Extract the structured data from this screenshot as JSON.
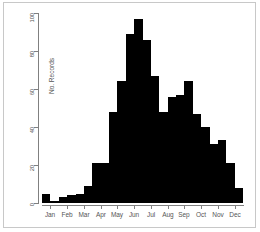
{
  "chart_data": {
    "type": "bar",
    "title": "",
    "subtitle": "",
    "xlabel": "",
    "ylabel": "No. Records",
    "ylim": [
      0,
      100
    ],
    "yticks": [
      0,
      20,
      40,
      60,
      80,
      100
    ],
    "ytick_labels": [
      "0",
      "20",
      "40",
      "60",
      "80",
      "100"
    ],
    "grid": false,
    "legend": null,
    "bar_color": "#000000",
    "axis_color": "#808080",
    "text_color": "#555555",
    "xtick_labels": [
      "Jan",
      "Feb",
      "Mar",
      "Apr",
      "May",
      "Jun",
      "Jul",
      "Aug",
      "Sep",
      "Oct",
      "Nov",
      "Dec"
    ],
    "note": "Histogram of records per half-month bin across the year; 24 bins, two per month.",
    "categories": [
      "Jan-1",
      "Jan-2",
      "Feb-1",
      "Feb-2",
      "Mar-1",
      "Mar-2",
      "Apr-1",
      "Apr-2",
      "May-1",
      "May-2",
      "Jun-1",
      "Jun-2",
      "Jul-1",
      "Jul-2",
      "Aug-1",
      "Aug-2",
      "Sep-1",
      "Sep-2",
      "Oct-1",
      "Oct-2",
      "Nov-1",
      "Nov-2",
      "Dec-1",
      "Dec-2"
    ],
    "values": [
      5,
      1,
      3,
      4,
      5,
      9,
      21,
      21,
      48,
      64,
      89,
      97,
      86,
      67,
      48,
      56,
      57,
      64,
      47,
      40,
      31,
      33,
      21,
      8
    ]
  }
}
